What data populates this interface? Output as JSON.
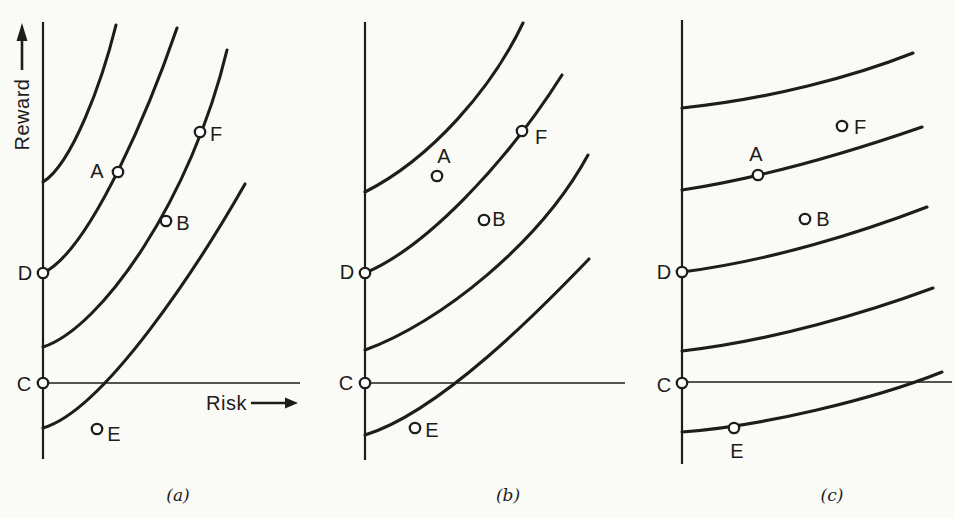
{
  "figure": {
    "background": "#fafaf7",
    "ink": "#1d1d1b",
    "marker_fill": "#ffffff",
    "y_axis_label": "Reward",
    "x_axis_label": "Risk",
    "captions": {
      "a": "(a)",
      "b": "(b)",
      "c": "(c)"
    },
    "panels": [
      {
        "id": "a",
        "y_axis": {
          "x": 43,
          "top": 22,
          "bottom": 459
        },
        "x_axis": {
          "y": 383,
          "x_start": 43,
          "x_end": 300
        },
        "curves": [
          {
            "name": "indifference-curve-1",
            "path": [
              [
                43,
                182
              ],
              [
                72,
                164
              ],
              [
                102,
                82
              ],
              [
                116,
                25
              ]
            ]
          },
          {
            "name": "indifference-curve-2",
            "path": [
              [
                43,
                273
              ],
              [
                92,
                250
              ],
              [
                153,
                98
              ],
              [
                177,
                28
              ]
            ]
          },
          {
            "name": "indifference-curve-3",
            "path": [
              [
                43,
                347
              ],
              [
                102,
                328
              ],
              [
                192,
                197
              ],
              [
                227,
                50
              ]
            ]
          },
          {
            "name": "indifference-curve-4",
            "path": [
              [
                43,
                428
              ],
              [
                105,
                410
              ],
              [
                200,
                263
              ],
              [
                245,
                184
              ]
            ]
          }
        ],
        "arrows": [
          {
            "name": "reward-axis-up-arrow",
            "shaft": [
              [
                22,
                70
              ],
              [
                22,
                34
              ]
            ],
            "head": [
              [
                22,
                23
              ],
              [
                16.5,
                41
              ],
              [
                27.5,
                41
              ]
            ]
          },
          {
            "name": "risk-axis-right-arrow",
            "shaft": [
              [
                251,
                403
              ],
              [
                287,
                403
              ]
            ],
            "head": [
              [
                298,
                403
              ],
              [
                285,
                397.5
              ],
              [
                285,
                408.5
              ]
            ]
          }
        ],
        "points": [
          {
            "label": "A",
            "x": 118,
            "y": 172,
            "label_x": 97,
            "label_y": 171,
            "on_curve": true
          },
          {
            "label": "F",
            "x": 200,
            "y": 132,
            "label_x": 216,
            "label_y": 134,
            "on_curve": true
          },
          {
            "label": "B",
            "x": 166,
            "y": 221,
            "label_x": 183,
            "label_y": 223,
            "on_curve": true
          },
          {
            "label": "D",
            "x": 43,
            "y": 273,
            "label_x": 25,
            "label_y": 273,
            "on_curve": true
          },
          {
            "label": "C",
            "x": 43,
            "y": 383,
            "label_x": 24,
            "label_y": 384,
            "on_curve": true
          },
          {
            "label": "E",
            "x": 97,
            "y": 429,
            "label_x": 114,
            "label_y": 434,
            "on_curve": false
          }
        ]
      },
      {
        "id": "b",
        "y_axis": {
          "x": 365,
          "top": 22,
          "bottom": 460
        },
        "x_axis": {
          "y": 383,
          "x_start": 365,
          "x_end": 625
        },
        "curves": [
          {
            "name": "indifference-curve-1",
            "path": [
              [
                365,
                192
              ],
              [
                432,
                158
              ],
              [
                492,
                88
              ],
              [
                523,
                23
              ]
            ]
          },
          {
            "name": "indifference-curve-2",
            "path": [
              [
                365,
                273
              ],
              [
                425,
                248
              ],
              [
                505,
                165
              ],
              [
                562,
                75
              ]
            ]
          },
          {
            "name": "indifference-curve-3",
            "path": [
              [
                365,
                350
              ],
              [
                440,
                323
              ],
              [
                540,
                243
              ],
              [
                588,
                155
              ]
            ]
          },
          {
            "name": "indifference-curve-4",
            "path": [
              [
                365,
                435
              ],
              [
                440,
                412
              ],
              [
                540,
                310
              ],
              [
                589,
                259
              ]
            ]
          }
        ],
        "arrows": [],
        "points": [
          {
            "label": "A",
            "x": 437,
            "y": 176,
            "label_x": 444,
            "label_y": 156,
            "on_curve": false
          },
          {
            "label": "F",
            "x": 522,
            "y": 131,
            "label_x": 541,
            "label_y": 137,
            "on_curve": true
          },
          {
            "label": "B",
            "x": 484,
            "y": 220,
            "label_x": 499,
            "label_y": 219,
            "on_curve": false
          },
          {
            "label": "D",
            "x": 365,
            "y": 273,
            "label_x": 347,
            "label_y": 272,
            "on_curve": true
          },
          {
            "label": "C",
            "x": 365,
            "y": 383,
            "label_x": 346,
            "label_y": 383,
            "on_curve": true
          },
          {
            "label": "E",
            "x": 415,
            "y": 428,
            "label_x": 432,
            "label_y": 430,
            "on_curve": false
          }
        ]
      },
      {
        "id": "c",
        "y_axis": {
          "x": 682,
          "top": 20,
          "bottom": 464
        },
        "x_axis": {
          "y": 382,
          "x_start": 682,
          "x_end": 952
        },
        "curves": [
          {
            "name": "indifference-curve-1",
            "path": [
              [
                682,
                108
              ],
              [
                770,
                99
              ],
              [
                855,
                76
              ],
              [
                913,
                53
              ]
            ]
          },
          {
            "name": "indifference-curve-2",
            "path": [
              [
                682,
                190
              ],
              [
                760,
                178
              ],
              [
                850,
                152
              ],
              [
                922,
                127
              ]
            ]
          },
          {
            "name": "indifference-curve-3",
            "path": [
              [
                682,
                272
              ],
              [
                770,
                261
              ],
              [
                862,
                232
              ],
              [
                927,
                207
              ]
            ]
          },
          {
            "name": "indifference-curve-4",
            "path": [
              [
                682,
                351
              ],
              [
                772,
                341
              ],
              [
                868,
                312
              ],
              [
                933,
                288
              ]
            ]
          },
          {
            "name": "indifference-curve-5",
            "path": [
              [
                682,
                432
              ],
              [
                762,
                426
              ],
              [
                872,
                400
              ],
              [
                942,
                372
              ]
            ]
          }
        ],
        "arrows": [],
        "points": [
          {
            "label": "A",
            "x": 758,
            "y": 175,
            "label_x": 756,
            "label_y": 154,
            "on_curve": true
          },
          {
            "label": "F",
            "x": 842,
            "y": 126,
            "label_x": 860,
            "label_y": 127,
            "on_curve": false
          },
          {
            "label": "B",
            "x": 805,
            "y": 219,
            "label_x": 823,
            "label_y": 219,
            "on_curve": false
          },
          {
            "label": "D",
            "x": 682,
            "y": 272,
            "label_x": 664,
            "label_y": 272,
            "on_curve": true
          },
          {
            "label": "C",
            "x": 682,
            "y": 383,
            "label_x": 664,
            "label_y": 385,
            "on_curve": true
          },
          {
            "label": "E",
            "x": 734,
            "y": 428,
            "label_x": 737,
            "label_y": 451,
            "on_curve": true
          }
        ]
      }
    ]
  }
}
